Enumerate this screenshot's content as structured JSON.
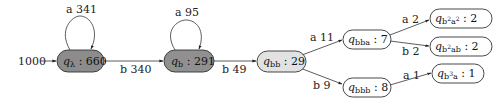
{
  "diagram": {
    "type": "prefix-tree automaton",
    "input": {
      "label": "1000"
    },
    "nodes": [
      {
        "id": "q_lambda",
        "state": "q",
        "subscript": "λ",
        "sup": "",
        "count": "660",
        "fill": "#8c8c8c"
      },
      {
        "id": "q_b",
        "state": "q",
        "subscript": "b",
        "count": "291",
        "fill": "#909090"
      },
      {
        "id": "q_bb",
        "state": "q",
        "subscript": "bb",
        "count": "29",
        "fill": "#e2e2e2"
      },
      {
        "id": "q_bba",
        "state": "q",
        "subscript": "bba",
        "count": "7",
        "fill": "#ffffff"
      },
      {
        "id": "q_bbb",
        "state": "q",
        "subscript": "bbb",
        "count": "8",
        "fill": "#ffffff"
      },
      {
        "id": "q_b2a2",
        "state": "q",
        "subscript_parts": [
          "b",
          "2",
          "a",
          "2"
        ],
        "count": "2",
        "fill": "#ffffff"
      },
      {
        "id": "q_b2ab",
        "state": "q",
        "subscript_parts": [
          "b",
          "2",
          "ab"
        ],
        "count": "2",
        "fill": "#ffffff"
      },
      {
        "id": "q_b3a",
        "state": "q",
        "subscript_parts": [
          "b",
          "3",
          "a"
        ],
        "count": "1",
        "fill": "#ffffff"
      }
    ],
    "edges": [
      {
        "from": "input",
        "to": "q_lambda",
        "label": "1000"
      },
      {
        "from": "q_lambda",
        "to": "q_lambda",
        "label": "a 341"
      },
      {
        "from": "q_lambda",
        "to": "q_b",
        "label": "b 340"
      },
      {
        "from": "q_b",
        "to": "q_b",
        "label": "a 95"
      },
      {
        "from": "q_b",
        "to": "q_bb",
        "label": "b 49"
      },
      {
        "from": "q_bb",
        "to": "q_bba",
        "label": "a 11"
      },
      {
        "from": "q_bb",
        "to": "q_bbb",
        "label": "b 9"
      },
      {
        "from": "q_bba",
        "to": "q_b2a2",
        "label": "a 2"
      },
      {
        "from": "q_bba",
        "to": "q_b2ab",
        "label": "b 2"
      },
      {
        "from": "q_bbb",
        "to": "q_b3a",
        "label": "a 1"
      }
    ],
    "separator": ":"
  }
}
